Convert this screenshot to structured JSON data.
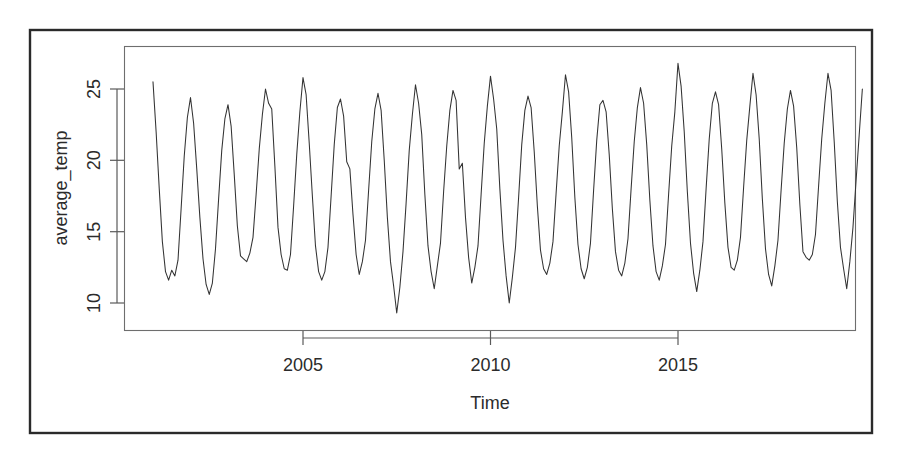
{
  "figure": {
    "background_color": "#ffffff",
    "frame_color": "#2a2a2a",
    "line_color": "#333333",
    "axis_color": "#5a5a5a"
  },
  "chart_data": {
    "type": "line",
    "title": "",
    "subtitle": "",
    "xlabel": "Time",
    "ylabel": "average_temp",
    "xlim": [
      2001.0,
      2019.2
    ],
    "ylim": [
      8.6,
      27.6
    ],
    "grid": false,
    "legend": null,
    "x_ticks": [
      2005,
      2010,
      2015
    ],
    "x_tick_labels": [
      "2005",
      "2010",
      "2015"
    ],
    "y_ticks": [
      10,
      15,
      20,
      25
    ],
    "y_tick_labels": [
      "10",
      "15",
      "20",
      "25"
    ],
    "series": [
      {
        "name": "average_temp",
        "x_start": 2001.0,
        "x_step": 0.08333,
        "values": [
          25.5,
          22.0,
          18.0,
          14.3,
          12.2,
          11.6,
          12.3,
          11.9,
          13.0,
          16.6,
          20.3,
          23.0,
          24.4,
          22.6,
          19.4,
          16.0,
          13.1,
          11.3,
          10.6,
          11.4,
          13.8,
          17.3,
          20.7,
          22.9,
          23.9,
          22.4,
          19.0,
          15.4,
          13.3,
          13.1,
          12.9,
          13.5,
          14.6,
          17.6,
          20.8,
          23.2,
          25.0,
          24.0,
          23.6,
          19.6,
          15.3,
          13.4,
          12.4,
          12.3,
          13.4,
          16.8,
          20.4,
          23.4,
          25.8,
          24.6,
          21.2,
          17.5,
          14.0,
          12.2,
          11.6,
          12.2,
          13.9,
          17.5,
          21.1,
          23.7,
          24.3,
          23.1,
          19.9,
          19.4,
          16.2,
          13.4,
          12.0,
          12.9,
          14.4,
          17.9,
          21.3,
          23.6,
          24.7,
          23.5,
          20.0,
          16.0,
          12.9,
          11.2,
          9.3,
          11.1,
          13.6,
          17.0,
          20.7,
          23.2,
          25.3,
          24.0,
          21.8,
          17.6,
          14.0,
          12.2,
          11.0,
          12.6,
          14.2,
          17.8,
          21.0,
          23.5,
          24.9,
          24.2,
          19.4,
          19.8,
          16.0,
          13.2,
          11.4,
          12.5,
          14.0,
          17.6,
          21.2,
          23.8,
          25.9,
          24.3,
          22.2,
          18.0,
          14.4,
          11.9,
          10.0,
          11.8,
          13.9,
          17.4,
          21.1,
          23.5,
          24.5,
          23.7,
          20.6,
          16.8,
          13.7,
          12.4,
          12.0,
          12.8,
          14.3,
          17.7,
          21.0,
          23.4,
          26.0,
          24.8,
          21.6,
          17.4,
          14.1,
          12.4,
          11.7,
          12.5,
          14.2,
          17.9,
          21.4,
          23.9,
          24.2,
          23.4,
          20.4,
          16.6,
          13.6,
          12.3,
          11.9,
          12.8,
          14.5,
          18.0,
          21.3,
          23.7,
          25.1,
          24.0,
          21.1,
          17.2,
          14.0,
          12.2,
          11.6,
          12.6,
          14.1,
          17.6,
          21.0,
          23.4,
          26.8,
          25.2,
          22.0,
          17.8,
          14.2,
          12.1,
          10.8,
          12.3,
          14.3,
          18.0,
          21.5,
          24.0,
          24.8,
          23.9,
          20.8,
          17.0,
          13.9,
          12.5,
          12.3,
          13.0,
          14.6,
          18.1,
          21.4,
          23.8,
          26.1,
          24.6,
          21.5,
          17.3,
          13.8,
          12.0,
          11.2,
          12.6,
          14.4,
          17.9,
          21.2,
          23.6,
          24.9,
          23.8,
          20.9,
          16.9,
          13.6,
          13.2,
          13.0,
          13.4,
          14.8,
          18.2,
          21.5,
          24.0,
          26.1,
          24.9,
          21.3,
          17.1,
          13.9,
          12.4,
          11.0,
          12.9,
          15.3,
          18.6,
          21.8,
          25.0
        ]
      }
    ]
  }
}
